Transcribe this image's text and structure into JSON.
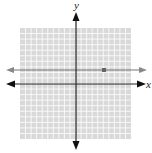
{
  "diagram": {
    "type": "coordinate-plane",
    "axes": {
      "x_label": "x",
      "y_label": "y"
    },
    "grid": {
      "cells_x": 20,
      "cells_y": 20,
      "range": [
        -10,
        10
      ],
      "color": "#d9d9d9",
      "line_color": "#ffffff"
    },
    "graphed_line": {
      "kind": "horizontal",
      "equation": "y = 3",
      "color": "#777777"
    },
    "point": {
      "x": 5,
      "y": 3,
      "color": "#777777"
    }
  },
  "chart_data": {
    "type": "line",
    "title": "",
    "xlabel": "x",
    "ylabel": "y",
    "xlim": [
      -10,
      10
    ],
    "ylim": [
      -10,
      10
    ],
    "grid": true,
    "series": [
      {
        "name": "y = 3",
        "x": [
          -10,
          10
        ],
        "y": [
          3,
          3
        ]
      }
    ],
    "points": [
      {
        "x": 5,
        "y": 3
      }
    ]
  }
}
